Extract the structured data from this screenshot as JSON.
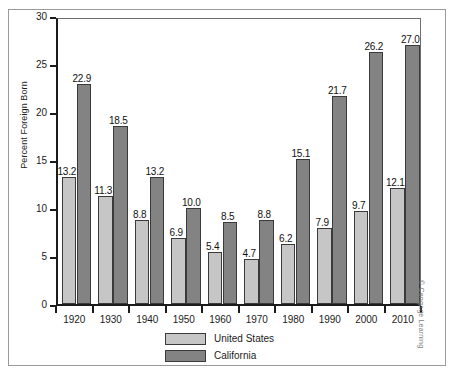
{
  "chart_data": {
    "type": "bar",
    "title": "",
    "xlabel": "",
    "ylabel": "Percent Foreign Born",
    "ylim": [
      0,
      30
    ],
    "yticks": [
      0,
      5,
      10,
      15,
      20,
      25,
      30
    ],
    "ytick_labels": [
      "0",
      "5",
      "10",
      "15",
      "20",
      "25",
      "30"
    ],
    "grid": false,
    "legend_position": "bottom-center",
    "categories": [
      "1920",
      "1930",
      "1940",
      "1950",
      "1960",
      "1970",
      "1980",
      "1990",
      "2000",
      "2010"
    ],
    "series": [
      {
        "name": "United States",
        "color": "#c6c6c6",
        "values": [
          13.2,
          11.3,
          8.8,
          6.9,
          5.4,
          4.7,
          6.2,
          7.9,
          9.7,
          12.1
        ],
        "labels": [
          "13.2",
          "11.3",
          "8.8",
          "6.9",
          "5.4",
          "4.7",
          "6.2",
          "7.9",
          "9.7",
          "12.1"
        ]
      },
      {
        "name": "California",
        "color": "#838383",
        "values": [
          22.9,
          18.5,
          13.2,
          10.0,
          8.5,
          8.8,
          15.1,
          21.7,
          26.2,
          27.0
        ],
        "labels": [
          "22.9",
          "18.5",
          "13.2",
          "10.0",
          "8.5",
          "8.8",
          "15.1",
          "21.7",
          "26.2",
          "27.0"
        ]
      }
    ]
  },
  "legend": {
    "items": [
      {
        "label": "United States",
        "color": "#c6c6c6"
      },
      {
        "label": "California",
        "color": "#838383"
      }
    ]
  },
  "credit": {
    "text": "© Cengage Learning"
  },
  "colors": {
    "series_us": "#c6c6c6",
    "series_ca": "#838383",
    "axis": "#1b1b1b",
    "frame": "#9a9a9a",
    "background": "#ffffff"
  }
}
